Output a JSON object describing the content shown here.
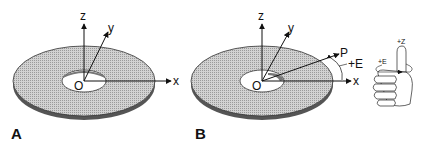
{
  "panels": [
    {
      "id": "A",
      "label": "A",
      "axes": {
        "x": "x",
        "y": "y",
        "z": "z",
        "origin": "O"
      }
    },
    {
      "id": "B",
      "label": "B",
      "axes": {
        "x": "x",
        "y": "y",
        "z": "z",
        "origin": "O"
      },
      "vector_label": "P",
      "angle_label": "+E",
      "hand": {
        "thumb_label": "+Z",
        "curl_label": "+E"
      }
    }
  ],
  "colors": {
    "disk_fill": "#c8c8c8",
    "disk_edge": "#555555",
    "hole_fill": "#ffffff",
    "line": "#111111"
  }
}
